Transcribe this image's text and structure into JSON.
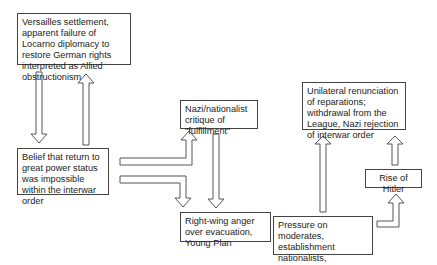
{
  "diagram": {
    "nodes": [
      {
        "id": "versailles",
        "text": "Versailles settlement, apparent failure of Locarno diplomacy to restore German rights interpreted as Allied obstructionism"
      },
      {
        "id": "belief",
        "text": "Belief that return to great power status was impossible within the interwar order"
      },
      {
        "id": "nazi_critique",
        "text": "Nazi/nationalist critique of \"fulfillment\""
      },
      {
        "id": "right_wing",
        "text": "Right-wing anger over evacuation, Young Plan"
      },
      {
        "id": "pressure",
        "text": "Pressure on moderates, establishment nationalists, conservatives"
      },
      {
        "id": "unilateral",
        "text": "Unilateral renunciation of reparations; withdrawal from the League, Nazi rejection of interwar order"
      },
      {
        "id": "hitler",
        "text": "Rise of Hitler"
      }
    ],
    "edges": [
      {
        "from": "versailles",
        "to": "belief"
      },
      {
        "from": "belief",
        "to": "versailles"
      },
      {
        "from": "belief",
        "to": "nazi_critique"
      },
      {
        "from": "belief",
        "to": "right_wing"
      },
      {
        "from": "nazi_critique",
        "to": "right_wing"
      },
      {
        "from": "right_wing",
        "to": "pressure"
      },
      {
        "from": "pressure",
        "to": "unilateral"
      },
      {
        "from": "pressure",
        "to": "hitler"
      },
      {
        "from": "hitler",
        "to": "unilateral"
      }
    ]
  }
}
